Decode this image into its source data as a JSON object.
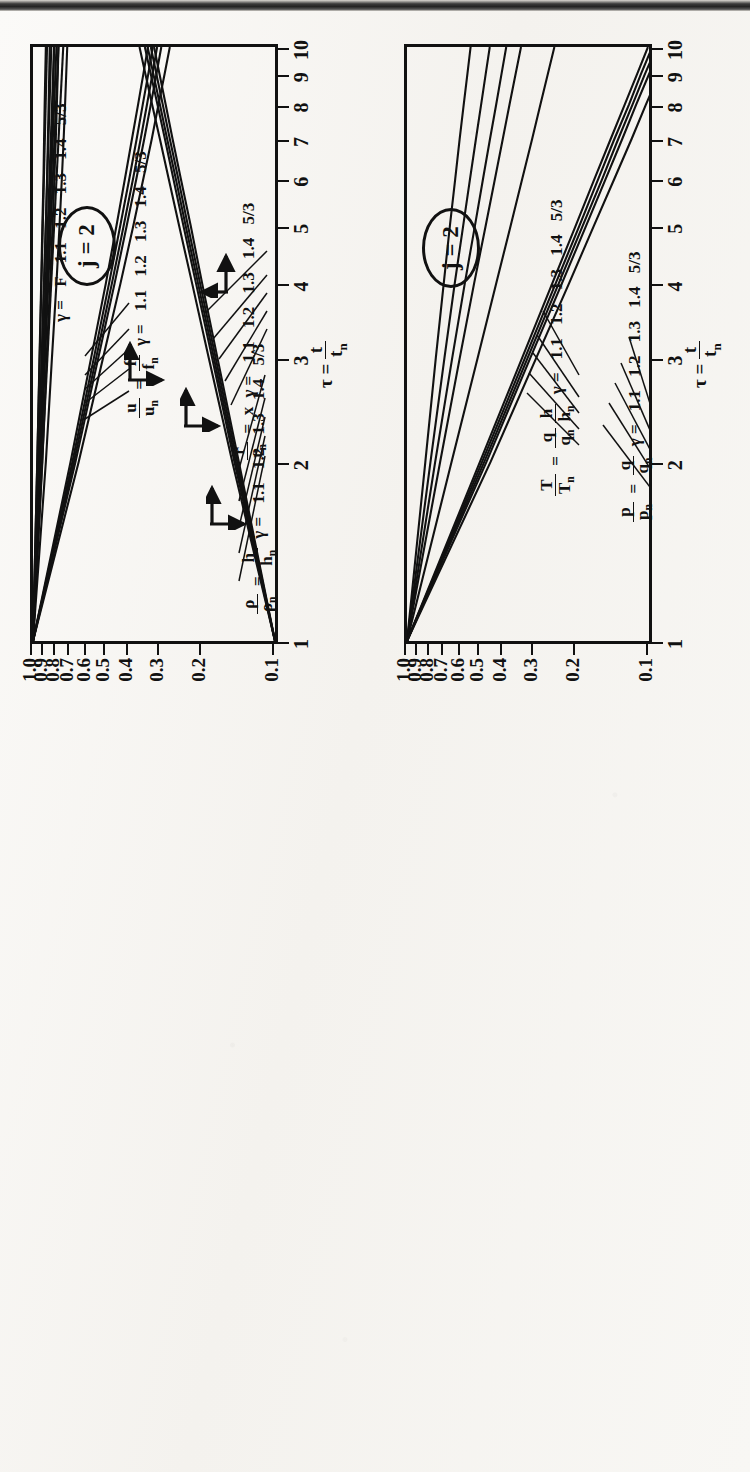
{
  "figure": {
    "kind": "scanned-figure",
    "panel_count": 2,
    "badge_text": "j = 2"
  },
  "axis": {
    "x_title_tau": "τ =",
    "x_title_num": "t",
    "x_title_den": "t",
    "x_title_den_sub": "n",
    "x_ticks": [
      "1",
      "2",
      "3",
      "4",
      "5",
      "6",
      "7",
      "8",
      "9",
      "10"
    ],
    "x_tick_values": [
      1,
      2,
      3,
      4,
      5,
      6,
      7,
      8,
      9,
      10
    ],
    "x_scale": "log",
    "y_ticks": [
      "1.0",
      "0.9",
      "0.8",
      "0.7",
      "0.6",
      "0.5",
      "0.4",
      "0.3",
      "0.2",
      "0.1"
    ],
    "y_tick_values": [
      1.0,
      0.9,
      0.8,
      0.7,
      0.6,
      0.5,
      0.4,
      0.3,
      0.2,
      0.1
    ],
    "y_scale": "log",
    "secondary_right_ticks": [
      "3",
      "2",
      "1"
    ],
    "secondary_right_values": [
      3,
      2,
      1
    ]
  },
  "gammas": [
    "1.1",
    "1.2",
    "1.3",
    "1.4",
    "5/3"
  ],
  "gamma_values": [
    1.1,
    1.2,
    1.3,
    1.4,
    1.6667
  ],
  "panel_a": {
    "badge": "j = 2",
    "legends": [
      {
        "id": "rho-h",
        "lhs_num": "ρ",
        "lhs_den": "ρ",
        "lhs_den_sub": "n",
        "eq": "=",
        "rhs_num": "h",
        "rhs_den": "h",
        "rhs_den_sub": "n",
        "gamma_prefix": "γ =",
        "values": [
          "1.1",
          "1.2",
          "1.3",
          "1.4",
          "5/3"
        ]
      },
      {
        "id": "u-f",
        "lhs_num": "u",
        "lhs_den": "u",
        "lhs_den_sub": "n",
        "eq": "=",
        "rhs_num": "f",
        "rhs_den": "f",
        "rhs_den_sub": "n",
        "gamma_prefix": "γ =",
        "values": [
          "1.1",
          "1.2",
          "1.3",
          "1.4",
          "5/3"
        ]
      },
      {
        "id": "r-x",
        "lhs_num": "r",
        "lhs_den": "r",
        "lhs_den_sub": "n",
        "eq": "=",
        "rhs_plain": "x",
        "gamma_prefix": "γ =",
        "values": [
          "1.1",
          "1.2",
          "1.3",
          "1.4",
          "5/3"
        ]
      },
      {
        "id": "F-family",
        "gamma_prefix": "γ =",
        "values": [
          "F",
          "1.1",
          "1.2",
          "1.3",
          "1.4",
          "5/3"
        ]
      }
    ]
  },
  "panel_b": {
    "badge": "j = 2",
    "legends": [
      {
        "id": "T-qh",
        "lhs_num": "T",
        "lhs_den": "T",
        "lhs_den_sub": "n",
        "eq": "=",
        "rhs_num": "q",
        "rhs_den": "q",
        "rhs_den_sub": "n",
        "rhs2_num": "h",
        "rhs2_den": "h",
        "rhs2_den_sub": "n",
        "gamma_prefix": "γ =",
        "values": [
          "1.1",
          "1.2",
          "1.3",
          "1.4",
          "5/3"
        ]
      },
      {
        "id": "p-q",
        "lhs_num": "p",
        "lhs_den": "p",
        "lhs_den_sub": "n",
        "eq": "=",
        "rhs_num": "q",
        "rhs_den": "q",
        "rhs_den_sub": "n",
        "gamma_prefix": "γ =",
        "values": [
          "1.1",
          "1.2",
          "1.3",
          "1.4",
          "5/3"
        ]
      }
    ]
  },
  "chart_data": [
    {
      "id": "panel_a",
      "type": "line",
      "title": "j = 2",
      "xlabel": "τ = t/t_n",
      "ylabel": "ratio",
      "xscale": "log",
      "yscale": "log",
      "xlim": [
        1,
        10
      ],
      "ylim": [
        0.1,
        1.0
      ],
      "grid": false,
      "legend_position": "inside",
      "annotations": [
        "j = 2",
        "ρ/ρn = h/hn",
        "u/un = f/fn",
        "r/rn = x",
        "γ = F"
      ],
      "series": [
        {
          "name": "rho/rho_n, γ=1.1",
          "group": "rho-h",
          "gamma": 1.1,
          "x": [
            1,
            2,
            3,
            4,
            5,
            6,
            7,
            8,
            9,
            10
          ],
          "y": [
            1.0,
            0.96,
            0.94,
            0.925,
            0.915,
            0.905,
            0.9,
            0.895,
            0.89,
            0.885
          ]
        },
        {
          "name": "rho/rho_n, γ=1.2",
          "group": "rho-h",
          "gamma": 1.2,
          "x": [
            1,
            2,
            3,
            4,
            5,
            6,
            7,
            8,
            9,
            10
          ],
          "y": [
            1.0,
            0.945,
            0.92,
            0.9,
            0.885,
            0.875,
            0.868,
            0.862,
            0.857,
            0.853
          ]
        },
        {
          "name": "rho/rho_n, γ=1.3",
          "group": "rho-h",
          "gamma": 1.3,
          "x": [
            1,
            2,
            3,
            4,
            5,
            6,
            7,
            8,
            9,
            10
          ],
          "y": [
            1.0,
            0.93,
            0.9,
            0.875,
            0.858,
            0.845,
            0.836,
            0.829,
            0.823,
            0.818
          ]
        },
        {
          "name": "rho/rho_n, γ=1.4",
          "group": "rho-h",
          "gamma": 1.4,
          "x": [
            1,
            2,
            3,
            4,
            5,
            6,
            7,
            8,
            9,
            10
          ],
          "y": [
            1.0,
            0.915,
            0.878,
            0.85,
            0.83,
            0.816,
            0.805,
            0.797,
            0.79,
            0.785
          ]
        },
        {
          "name": "rho/rho_n, γ=5/3",
          "group": "rho-h",
          "gamma": 1.6667,
          "x": [
            1,
            2,
            3,
            4,
            5,
            6,
            7,
            8,
            9,
            10
          ],
          "y": [
            1.0,
            0.885,
            0.835,
            0.8,
            0.777,
            0.76,
            0.747,
            0.737,
            0.729,
            0.722
          ]
        },
        {
          "name": "u/u_n, γ=1.1",
          "group": "u-f",
          "gamma": 1.1,
          "x": [
            1,
            2,
            3,
            4,
            5,
            6,
            7,
            8,
            9,
            10
          ],
          "y": [
            1.0,
            0.7,
            0.575,
            0.5,
            0.452,
            0.417,
            0.39,
            0.368,
            0.35,
            0.335
          ]
        },
        {
          "name": "u/u_n, γ=1.2",
          "group": "u-f",
          "gamma": 1.2,
          "x": [
            1,
            2,
            3,
            4,
            5,
            6,
            7,
            8,
            9,
            10
          ],
          "y": [
            1.0,
            0.688,
            0.56,
            0.485,
            0.436,
            0.4,
            0.373,
            0.352,
            0.334,
            0.32
          ]
        },
        {
          "name": "u/u_n, γ=1.3",
          "group": "u-f",
          "gamma": 1.3,
          "x": [
            1,
            2,
            3,
            4,
            5,
            6,
            7,
            8,
            9,
            10
          ],
          "y": [
            1.0,
            0.678,
            0.548,
            0.472,
            0.422,
            0.386,
            0.359,
            0.338,
            0.321,
            0.307
          ]
        },
        {
          "name": "u/u_n, γ=1.4",
          "group": "u-f",
          "gamma": 1.4,
          "x": [
            1,
            2,
            3,
            4,
            5,
            6,
            7,
            8,
            9,
            10
          ],
          "y": [
            1.0,
            0.668,
            0.537,
            0.46,
            0.41,
            0.374,
            0.347,
            0.326,
            0.309,
            0.295
          ]
        },
        {
          "name": "u/u_n, γ=5/3",
          "group": "u-f",
          "gamma": 1.6667,
          "x": [
            1,
            2,
            3,
            4,
            5,
            6,
            7,
            8,
            9,
            10
          ],
          "y": [
            1.0,
            0.648,
            0.513,
            0.435,
            0.385,
            0.35,
            0.323,
            0.303,
            0.286,
            0.272
          ]
        },
        {
          "name": "r/r_n, γ=1.1",
          "group": "r-x",
          "gamma": 1.1,
          "x": [
            1,
            2,
            3,
            4,
            5,
            6,
            7,
            8,
            9,
            10
          ],
          "y": [
            0.1,
            0.141,
            0.173,
            0.2,
            0.223,
            0.245,
            0.265,
            0.283,
            0.3,
            0.316
          ]
        },
        {
          "name": "r/r_n, γ=1.2",
          "group": "r-x",
          "gamma": 1.2,
          "x": [
            1,
            2,
            3,
            4,
            5,
            6,
            7,
            8,
            9,
            10
          ],
          "y": [
            0.1,
            0.143,
            0.176,
            0.204,
            0.229,
            0.251,
            0.272,
            0.291,
            0.309,
            0.326
          ]
        },
        {
          "name": "r/r_n, γ=1.3",
          "group": "r-x",
          "gamma": 1.3,
          "x": [
            1,
            2,
            3,
            4,
            5,
            6,
            7,
            8,
            9,
            10
          ],
          "y": [
            0.1,
            0.145,
            0.179,
            0.208,
            0.234,
            0.257,
            0.279,
            0.299,
            0.318,
            0.336
          ]
        },
        {
          "name": "r/r_n, γ=1.4",
          "group": "r-x",
          "gamma": 1.4,
          "x": [
            1,
            2,
            3,
            4,
            5,
            6,
            7,
            8,
            9,
            10
          ],
          "y": [
            0.1,
            0.147,
            0.182,
            0.212,
            0.239,
            0.263,
            0.285,
            0.306,
            0.326,
            0.345
          ]
        },
        {
          "name": "r/r_n, γ=5/3",
          "group": "r-x",
          "gamma": 1.6667,
          "x": [
            1,
            2,
            3,
            4,
            5,
            6,
            7,
            8,
            9,
            10
          ],
          "y": [
            0.1,
            0.15,
            0.188,
            0.22,
            0.249,
            0.275,
            0.299,
            0.322,
            0.343,
            0.363
          ]
        },
        {
          "name": "F, γ=F",
          "group": "F-family",
          "gamma": null,
          "x": [
            1,
            10
          ],
          "y": [
            1.0,
            0.75
          ]
        },
        {
          "name": "F, γ=1.1",
          "group": "F-family",
          "gamma": 1.1,
          "x": [
            1,
            10
          ],
          "y": [
            1.0,
            0.785
          ]
        },
        {
          "name": "F, γ=1.2",
          "group": "F-family",
          "gamma": 1.2,
          "x": [
            1,
            10
          ],
          "y": [
            1.0,
            0.8
          ]
        },
        {
          "name": "F, γ=1.3",
          "group": "F-family",
          "gamma": 1.3,
          "x": [
            1,
            10
          ],
          "y": [
            1.0,
            0.818
          ]
        },
        {
          "name": "F, γ=1.4",
          "group": "F-family",
          "gamma": 1.4,
          "x": [
            1,
            10
          ],
          "y": [
            1.0,
            0.84
          ]
        },
        {
          "name": "F, γ=5/3",
          "group": "F-family",
          "gamma": 1.6667,
          "x": [
            1,
            10
          ],
          "y": [
            1.0,
            0.875
          ]
        }
      ]
    },
    {
      "id": "panel_b",
      "type": "line",
      "title": "j = 2",
      "xlabel": "τ = t/t_n",
      "ylabel": "ratio",
      "xscale": "log",
      "yscale": "log",
      "xlim": [
        1,
        10
      ],
      "ylim": [
        0.1,
        1.0
      ],
      "grid": false,
      "legend_position": "inside",
      "annotations": [
        "j = 2",
        "T/Tn = (q/qn)(h/hn)",
        "p/pn = q/qn"
      ],
      "series": [
        {
          "name": "T/T_n, γ=1.1",
          "group": "T-qh",
          "gamma": 1.1,
          "x": [
            1,
            2,
            3,
            4,
            5,
            6,
            7,
            8,
            9,
            10
          ],
          "y": [
            1.0,
            0.84,
            0.76,
            0.705,
            0.665,
            0.632,
            0.606,
            0.583,
            0.563,
            0.546
          ]
        },
        {
          "name": "T/T_n, γ=1.2",
          "group": "T-qh",
          "gamma": 1.2,
          "x": [
            1,
            2,
            3,
            4,
            5,
            6,
            7,
            8,
            9,
            10
          ],
          "y": [
            1.0,
            0.8,
            0.7,
            0.635,
            0.586,
            0.549,
            0.519,
            0.494,
            0.473,
            0.455
          ]
        },
        {
          "name": "T/T_n, γ=1.3",
          "group": "T-qh",
          "gamma": 1.3,
          "x": [
            1,
            2,
            3,
            4,
            5,
            6,
            7,
            8,
            9,
            10
          ],
          "y": [
            1.0,
            0.765,
            0.65,
            0.577,
            0.524,
            0.485,
            0.454,
            0.428,
            0.407,
            0.389
          ]
        },
        {
          "name": "T/T_n, γ=1.4",
          "group": "T-qh",
          "gamma": 1.4,
          "x": [
            1,
            2,
            3,
            4,
            5,
            6,
            7,
            8,
            9,
            10
          ],
          "y": [
            1.0,
            0.73,
            0.605,
            0.528,
            0.473,
            0.433,
            0.402,
            0.377,
            0.356,
            0.338
          ]
        },
        {
          "name": "T/T_n, γ=5/3",
          "group": "T-qh",
          "gamma": 1.6667,
          "x": [
            1,
            2,
            3,
            4,
            5,
            6,
            7,
            8,
            9,
            10
          ],
          "y": [
            1.0,
            0.655,
            0.51,
            0.428,
            0.373,
            0.334,
            0.304,
            0.281,
            0.262,
            0.246
          ]
        },
        {
          "name": "p/p_n, γ=1.1",
          "group": "p-q",
          "gamma": 1.1,
          "x": [
            1,
            2,
            3,
            4,
            5,
            6,
            7,
            8,
            9,
            10
          ],
          "y": [
            1.0,
            0.5,
            0.334,
            0.251,
            0.201,
            0.168,
            0.144,
            0.126,
            0.112,
            0.101
          ]
        },
        {
          "name": "p/p_n, γ=1.2",
          "group": "p-q",
          "gamma": 1.2,
          "x": [
            1,
            2,
            3,
            4,
            5,
            6,
            7,
            8,
            9,
            10
          ],
          "y": [
            1.0,
            0.49,
            0.325,
            0.243,
            0.194,
            0.162,
            0.139,
            0.121,
            0.108,
            0.097
          ]
        },
        {
          "name": "p/p_n, γ=1.3",
          "group": "p-q",
          "gamma": 1.3,
          "x": [
            1,
            2,
            3,
            4,
            5,
            6,
            7,
            8,
            9,
            10
          ],
          "y": [
            1.0,
            0.48,
            0.317,
            0.236,
            0.188,
            0.156,
            0.134,
            0.117,
            0.104,
            0.093
          ]
        },
        {
          "name": "p/p_n, γ=1.4",
          "group": "p-q",
          "gamma": 1.4,
          "x": [
            1,
            2,
            3,
            4,
            5,
            6,
            7,
            8,
            9,
            10
          ],
          "y": [
            1.0,
            0.47,
            0.309,
            0.229,
            0.182,
            0.151,
            0.129,
            0.113,
            0.1,
            0.09
          ]
        },
        {
          "name": "p/p_n, γ=5/3",
          "group": "p-q",
          "gamma": 1.6667,
          "x": [
            1,
            2,
            3,
            4,
            5,
            6,
            7,
            8,
            9,
            10
          ],
          "y": [
            1.0,
            0.452,
            0.292,
            0.214,
            0.169,
            0.139,
            0.118,
            0.103,
            0.091,
            0.081
          ]
        }
      ]
    }
  ]
}
